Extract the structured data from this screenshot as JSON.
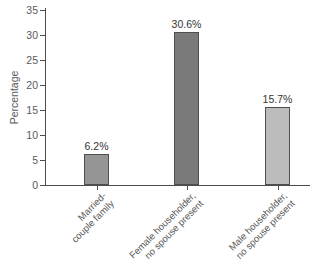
{
  "chart_data": {
    "type": "bar",
    "title": "",
    "xlabel": "",
    "ylabel": "Percentage",
    "ylim": [
      0,
      35
    ],
    "yticks": [
      0,
      5,
      10,
      15,
      20,
      25,
      30,
      35
    ],
    "grid": false,
    "legend": "none",
    "categories": [
      "Married-couple family",
      "Female householder, no spouse present",
      "Male householder, no spouse present"
    ],
    "category_lines": [
      [
        "Married-",
        "couple family"
      ],
      [
        "Female householder,",
        "no spouse present"
      ],
      [
        "Male householder,",
        "no spouse present"
      ]
    ],
    "values": [
      6.2,
      30.6,
      15.7
    ],
    "data_labels": [
      "6.2%",
      "30.6%",
      "15.7%"
    ],
    "colors": {
      "bar_fills": [
        "#959595",
        "#7a7a7a",
        "#bcbcbc"
      ],
      "bar_border": "#4f4f4f",
      "axis": "#4d4d4d",
      "tick_text": "#5a5a5a",
      "data_label_text": "#333333",
      "background": "#ffffff"
    }
  }
}
